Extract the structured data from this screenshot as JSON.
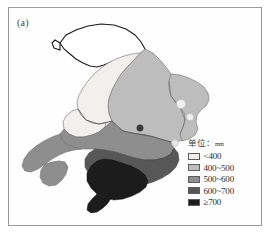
{
  "figure": {
    "panel_label": "(a)",
    "border_color": "#9a9a9a",
    "background": "#ffffff"
  },
  "legend": {
    "title_text": "单位：",
    "title_unit": "mm",
    "position": "bottom-right",
    "items": [
      {
        "label": "<400",
        "color": "#f2f0ec",
        "min": 0,
        "max": 400
      },
      {
        "label": "400~500",
        "color": "#bdbdbd",
        "min": 400,
        "max": 500
      },
      {
        "label": "500~600",
        "color": "#8e8e8e",
        "min": 500,
        "max": 600
      },
      {
        "label": "600~700",
        "color": "#575757",
        "min": 600,
        "max": 700
      },
      {
        "label": "≥700",
        "color": "#1c1c1c",
        "min": 700,
        "max": null
      }
    ]
  },
  "chart_data": {
    "type": "heatmap",
    "title": "(a)",
    "subtitle": "",
    "xlabel": "",
    "ylabel": "",
    "variable": "precipitation",
    "unit": "mm",
    "classes": [
      "<400",
      "400~500",
      "500~600",
      "600~700",
      "≥700"
    ],
    "class_colors": [
      "#f2f0ec",
      "#bdbdbd",
      "#8e8e8e",
      "#575757",
      "#1c1c1c"
    ],
    "regions": [
      {
        "name": "northern-outlined-region",
        "class": "none",
        "value": null,
        "fill": "#ffffff"
      },
      {
        "name": "north-central-belt",
        "class": "400~500",
        "value": 450,
        "fill": "#bdbdbd"
      },
      {
        "name": "west-pale-wedge",
        "class": "<400",
        "value": 380,
        "fill": "#f2f0ec"
      },
      {
        "name": "northeast-body",
        "class": "400~500",
        "value": 460,
        "fill": "#bdbdbd"
      },
      {
        "name": "central-band",
        "class": "500~600",
        "value": 550,
        "fill": "#8e8e8e"
      },
      {
        "name": "west-peninsula",
        "class": "500~600",
        "value": 540,
        "fill": "#8e8e8e"
      },
      {
        "name": "south-dark-zone",
        "class": "600~700",
        "value": 650,
        "fill": "#575757"
      },
      {
        "name": "south-core-darkest",
        "class": "≥700",
        "value": 720,
        "fill": "#1c1c1c"
      }
    ],
    "markers": [
      {
        "name": "lake-marker-north",
        "kind": "light-circle",
        "x": 173,
        "y": 97
      },
      {
        "name": "lake-marker-south",
        "kind": "light-circle",
        "x": 182,
        "y": 110
      },
      {
        "name": "lake-marker-east",
        "kind": "light-circle",
        "x": 167,
        "y": 136
      },
      {
        "name": "station-dot",
        "kind": "dark-dot",
        "x": 132,
        "y": 121
      }
    ],
    "grid": false,
    "legend_position": "bottom-right"
  }
}
